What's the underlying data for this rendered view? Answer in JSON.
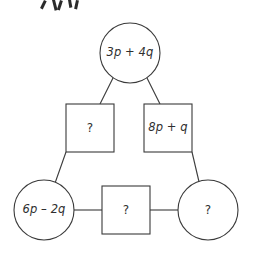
{
  "diagram": {
    "type": "algebra-loop-puzzle",
    "stroke_color": "#3a3a3a",
    "text_color": "#2f2f2f",
    "background_color": "#ffffff",
    "nodes": [
      {
        "id": "top-circle",
        "shape": "circle",
        "label": "3p + 4q",
        "known": true,
        "cx": 130,
        "cy": 53,
        "r": 30
      },
      {
        "id": "left-square",
        "shape": "square",
        "label": "?",
        "known": false,
        "x": 66,
        "y": 104,
        "size": 48
      },
      {
        "id": "right-square",
        "shape": "square",
        "label": "8p + q",
        "known": true,
        "x": 144,
        "y": 104,
        "size": 48
      },
      {
        "id": "bottom-left-circle",
        "shape": "circle",
        "label": "6p – 2q",
        "known": true,
        "cx": 44,
        "cy": 210,
        "r": 30
      },
      {
        "id": "bottom-middle-square",
        "shape": "square",
        "label": "?",
        "known": false,
        "x": 102,
        "y": 186,
        "size": 48
      },
      {
        "id": "bottom-right-circle",
        "shape": "circle",
        "label": "?",
        "known": false,
        "cx": 208,
        "cy": 210,
        "r": 30
      }
    ],
    "edges": [
      {
        "id": "edge-top-left",
        "from": "top-circle",
        "to": "left-square",
        "x1": 113,
        "y1": 78,
        "x2": 100,
        "y2": 104
      },
      {
        "id": "edge-top-right",
        "from": "top-circle",
        "to": "right-square",
        "x1": 147,
        "y1": 78,
        "x2": 160,
        "y2": 104
      },
      {
        "id": "edge-left-down",
        "from": "left-square",
        "to": "bottom-left-circle",
        "x1": 66,
        "y1": 152,
        "x2": 54,
        "y2": 186
      },
      {
        "id": "edge-right-down",
        "from": "right-square",
        "to": "bottom-right-circle",
        "x1": 192,
        "y1": 152,
        "x2": 200,
        "y2": 186
      },
      {
        "id": "edge-bottom-left",
        "from": "bottom-left-circle",
        "to": "bottom-middle-square",
        "x1": 74,
        "y1": 210,
        "x2": 102,
        "y2": 210
      },
      {
        "id": "edge-bottom-right",
        "from": "bottom-middle-square",
        "to": "bottom-right-circle",
        "x1": 150,
        "y1": 210,
        "x2": 178,
        "y2": 210
      }
    ],
    "unknown_marker": "?"
  }
}
